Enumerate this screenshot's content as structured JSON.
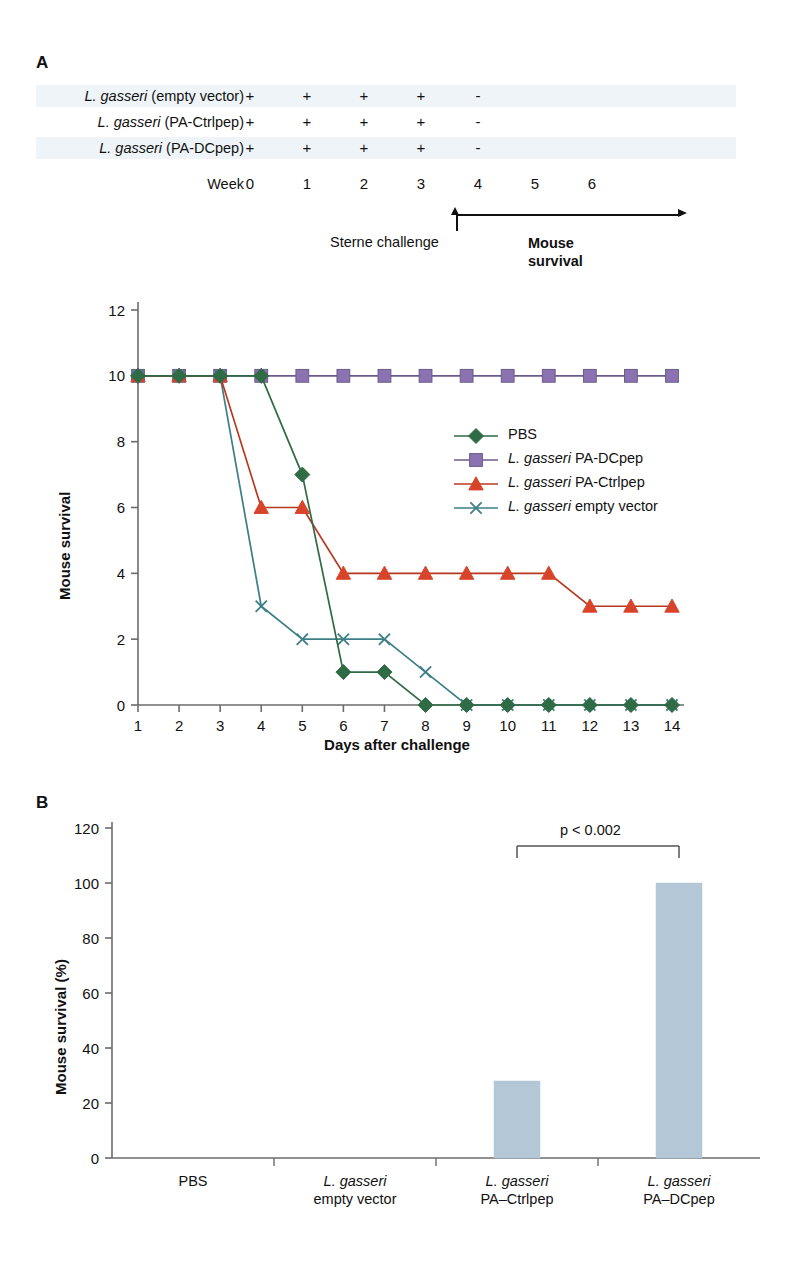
{
  "panels": {
    "a_letter": "A",
    "b_letter": "B"
  },
  "schedule": {
    "rows": [
      {
        "label_italic": "L. gasseri",
        "label_rest": " (empty vector)",
        "marks": [
          "+",
          "+",
          "+",
          "+",
          "-",
          "",
          ""
        ]
      },
      {
        "label_italic": "L. gasseri",
        "label_rest": " (PA-Ctrlpep)",
        "marks": [
          "+",
          "+",
          "+",
          "+",
          "-",
          "",
          ""
        ]
      },
      {
        "label_italic": "L. gasseri",
        "label_rest": " (PA-DCpep)",
        "marks": [
          "+",
          "+",
          "+",
          "+",
          "-",
          "",
          ""
        ]
      }
    ],
    "week_word": "Week",
    "weeks": [
      "0",
      "1",
      "2",
      "3",
      "4",
      "5",
      "6"
    ],
    "sterne_challenge": "Sterne challenge",
    "mouse_survival_line1": "Mouse",
    "mouse_survival_line2": "survival"
  },
  "chart_data": [
    {
      "type": "line",
      "title": "",
      "xlabel": "Days after challenge",
      "ylabel": "Mouse survival",
      "x": [
        1,
        2,
        3,
        4,
        5,
        6,
        7,
        8,
        9,
        10,
        11,
        12,
        13,
        14
      ],
      "xlim": [
        1,
        14
      ],
      "ylim": [
        0,
        12
      ],
      "yticks": [
        0,
        2,
        4,
        6,
        8,
        10,
        12
      ],
      "xticks": [
        "1",
        "2",
        "3",
        "4",
        "5",
        "6",
        "7",
        "8",
        "9",
        "10",
        "11",
        "12",
        "13",
        "14"
      ],
      "grid": false,
      "legend_position": "inside-right",
      "series": [
        {
          "name": "PBS",
          "name_italic_prefix": "",
          "marker": "diamond",
          "color": "#2f6b45",
          "values": [
            10,
            10,
            10,
            10,
            7,
            1,
            1,
            0,
            0,
            0,
            0,
            0,
            0,
            0
          ]
        },
        {
          "name": " PA-DCpep",
          "name_italic_prefix": "L. gasseri",
          "marker": "square",
          "color": "#8b72b0",
          "line_color": "#6b5b8a",
          "values": [
            10,
            10,
            10,
            10,
            10,
            10,
            10,
            10,
            10,
            10,
            10,
            10,
            10,
            10
          ]
        },
        {
          "name": " PA-Ctrlpep",
          "name_italic_prefix": "L. gasseri",
          "marker": "triangle",
          "color": "#d8442a",
          "line_color": "#b8371f",
          "values": [
            10,
            10,
            10,
            6,
            6,
            4,
            4,
            4,
            4,
            4,
            4,
            3,
            3,
            3
          ]
        },
        {
          "name": " empty vector",
          "name_italic_prefix": "L. gasseri",
          "marker": "cross",
          "color": "#3c7f86",
          "line_color": "#3c7f86",
          "values": [
            10,
            10,
            10,
            3,
            2,
            2,
            2,
            1,
            0,
            0,
            0,
            0,
            0,
            0
          ]
        }
      ]
    },
    {
      "type": "bar",
      "title": "",
      "xlabel": "",
      "ylabel": "Mouse survival (%)",
      "categories": [
        "PBS",
        "L. gasseri empty vector",
        "L. gasseri PA–Ctrlpep",
        "L. gasseri PA–DCpep"
      ],
      "category_labels": [
        {
          "line1": "PBS",
          "line1_italic": false,
          "line2": ""
        },
        {
          "line1": "L. gasseri",
          "line1_italic": true,
          "line2": "empty vector"
        },
        {
          "line1": "L. gasseri",
          "line1_italic": true,
          "line2": "PA–Ctrlpep"
        },
        {
          "line1": "L. gasseri",
          "line1_italic": true,
          "line2": "PA–DCpep"
        }
      ],
      "values": [
        0,
        0,
        28,
        100
      ],
      "ylim": [
        0,
        120
      ],
      "yticks": [
        0,
        20,
        40,
        60,
        80,
        100,
        120
      ],
      "bar_color": "#b4c7d6",
      "grid": false,
      "annotations": [
        {
          "text": "p < 0.002",
          "between": [
            2,
            3
          ]
        }
      ]
    }
  ],
  "colors": {
    "pbs_green": "#2f6b45",
    "dcpep_purple": "#8b72b0",
    "ctrlpep_red": "#d8442a",
    "empty_vector_teal": "#3c7f86",
    "bar_blue": "#b4c7d6",
    "axis_gray": "#6b6b6b",
    "shaded_row": "#eef4f7"
  }
}
